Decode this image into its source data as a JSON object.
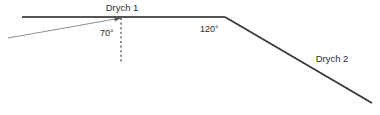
{
  "diagram": {
    "type": "optics-ray-diagram",
    "background_color": "#ffffff",
    "mirror1": {
      "label": "Drych 1",
      "label_x": 122,
      "label_y": 11,
      "line_color": "#555555",
      "line_width": 2.1,
      "x1": 22,
      "y1": 17,
      "x2": 225,
      "y2": 17
    },
    "mirror2": {
      "label": "Drych 2",
      "label_x": 332,
      "label_y": 62,
      "line_color": "#3a3a3a",
      "line_width": 1.9,
      "x1": 225,
      "y1": 17,
      "x2": 372,
      "y2": 103
    },
    "incident_ray": {
      "name": "incident-ray",
      "line_color": "#8d8d8d",
      "line_width": 1.0,
      "x1": 8,
      "y1": 38,
      "x2": 121,
      "y2": 18,
      "arrowhead": true,
      "arrowhead_color": "#555555"
    },
    "normal_line": {
      "name": "normal-dashed-line",
      "line_color": "#1a1a1a",
      "line_width": 1.0,
      "dash": "2,2.6",
      "x": 121,
      "y1": 18,
      "y2": 62
    },
    "angles": [
      {
        "name": "angle-of-incidence",
        "value": "70°",
        "x": 100,
        "y": 36
      },
      {
        "name": "angle-between-mirrors",
        "value": "120°",
        "x": 200,
        "y": 32
      }
    ]
  }
}
